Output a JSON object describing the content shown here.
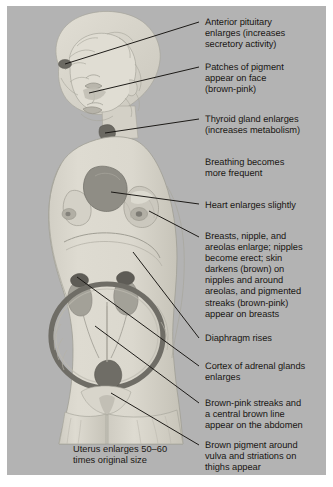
{
  "figure": {
    "panel_background_color": "#b3b3b3",
    "text_color": "#1a1713",
    "page_background_color": "#ffffff"
  },
  "illustration": {
    "subject": "pregnant-woman-side-view",
    "skin_color": "#dcd9cf",
    "skin_shadow_color": "#c9c6bb",
    "hair_color": "#d9d6cc",
    "outline_color": "#9c9a90",
    "organ_colors": {
      "heart": "#8f8d85",
      "breast_highlight": "#c4c2b8",
      "uterus_ring": "#6f6d66",
      "cervix": "#6f6d66",
      "kidney": "#a09e95",
      "adrenal": "#5e5c56",
      "pituitary": "#6b6962",
      "thyroid": "#6b6962"
    },
    "organs": [
      {
        "name": "anterior-pituitary",
        "note": "small dark spot at forehead/brain base"
      },
      {
        "name": "face-pigment-patch",
        "note": "shaded patch on cheek"
      },
      {
        "name": "thyroid-gland",
        "note": "dark spot at base of neck"
      },
      {
        "name": "heart",
        "note": "large dark blob in chest"
      },
      {
        "name": "breast",
        "note": "breast with nipple and areola"
      },
      {
        "name": "diaphragm",
        "note": "curved line above abdomen"
      },
      {
        "name": "kidney-left",
        "note": "kidney with adrenal cortex cap"
      },
      {
        "name": "kidney-right",
        "note": "kidney with adrenal cortex cap"
      },
      {
        "name": "uterus",
        "note": "large dark ring filling abdomen"
      },
      {
        "name": "cervix-vagina",
        "note": "dark shape at base of uterus"
      },
      {
        "name": "abdominal-streaks",
        "note": "striae and linea nigra on abdomen"
      },
      {
        "name": "thigh-striations",
        "note": "striations on thighs"
      }
    ]
  },
  "callouts": [
    {
      "id": "anterior-pituitary",
      "text": "Anterior pituitary\nenlarges (increases\nsecretory activity)",
      "text_x": 198,
      "text_y": 13,
      "leader": {
        "x1": 58,
        "y1": 58,
        "x2": 192,
        "y2": 16
      }
    },
    {
      "id": "face-pigment",
      "text": "Patches of pigment\nappear on face\n(brown-pink)",
      "text_x": 198,
      "text_y": 58,
      "leader": {
        "x1": 82,
        "y1": 87,
        "x2": 192,
        "y2": 61
      }
    },
    {
      "id": "thyroid-gland",
      "text": "Thyroid gland enlarges\n(increases metabolism)",
      "text_x": 198,
      "text_y": 110,
      "leader": {
        "x1": 98,
        "y1": 127,
        "x2": 192,
        "y2": 113
      }
    },
    {
      "id": "breathing",
      "text": "Breathing becomes\nmore frequent",
      "text_x": 198,
      "text_y": 153,
      "leader": null
    },
    {
      "id": "heart",
      "text": "Heart enlarges slightly",
      "text_x": 198,
      "text_y": 196,
      "leader": {
        "x1": 104,
        "y1": 186,
        "x2": 192,
        "y2": 198
      }
    },
    {
      "id": "breasts",
      "text": "Breasts, nipple, and\nareolas enlarge; nipples\nbecome erect; skin\ndarkens (brown) on\nnipples and around\nareolas, and pigmented\nstreaks (brown-pink)\nappear on breasts",
      "text_x": 198,
      "text_y": 227,
      "leader": {
        "x1": 142,
        "y1": 205,
        "x2": 192,
        "y2": 231
      }
    },
    {
      "id": "diaphragm",
      "text": "Diaphragm rises",
      "text_x": 198,
      "text_y": 330,
      "leader": {
        "x1": 126,
        "y1": 246,
        "x2": 192,
        "y2": 332
      }
    },
    {
      "id": "adrenal-cortex",
      "text": "Cortex of adrenal glands\nenlarges",
      "text_x": 198,
      "text_y": 358,
      "leader": {
        "x1": 70,
        "y1": 271,
        "x2": 192,
        "y2": 360
      }
    },
    {
      "id": "abdominal-streaks",
      "text": "Brown-pink streaks and\na central brown line\nappear on the abdomen",
      "text_x": 198,
      "text_y": 395,
      "leader": {
        "x1": 88,
        "y1": 320,
        "x2": 192,
        "y2": 397
      }
    },
    {
      "id": "vulva-thigh-pigment",
      "text": "Brown pigment around\nvulva and striations on\nthighs appear",
      "text_x": 198,
      "text_y": 437,
      "leader": {
        "x1": 104,
        "y1": 387,
        "x2": 192,
        "y2": 439
      }
    }
  ],
  "caption": {
    "text": "Uterus enlarges 50–60\ntimes original size",
    "x": 66,
    "y": 441
  }
}
